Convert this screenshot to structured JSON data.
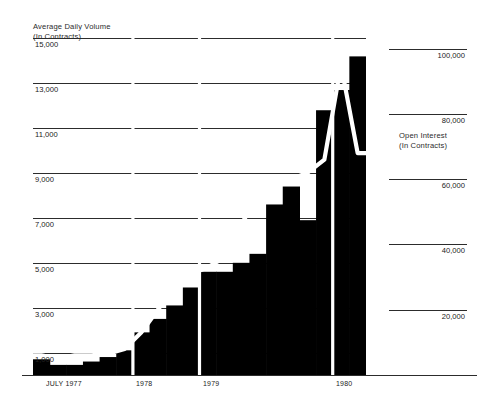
{
  "left_axis": {
    "title_line1": "Average Daily Volume",
    "title_line2": "(In Contracts)",
    "ticks": [
      "15,000",
      "13,000",
      "11,000",
      "9,000",
      "7,000",
      "5,000",
      "3,000",
      "1,000"
    ]
  },
  "right_axis": {
    "title_line1": "Open Interest",
    "title_line2": "(In Contracts)",
    "ticks": [
      "100,000",
      "80,000",
      "60,000",
      "40,000",
      "20,000"
    ]
  },
  "x_axis": {
    "ticks": [
      "JULY 1977",
      "1978",
      "1979",
      "1980"
    ]
  },
  "colors": {
    "bars": "#000000",
    "line": "#ffffff",
    "axis": "#2c2c2c",
    "background": "#ffffff",
    "text": "#222222"
  },
  "chart_data": {
    "type": "bar",
    "title": "Average Daily Volume",
    "subtitle": "(In Contracts)",
    "xlabel": "",
    "ylabel": "Average Daily Volume (In Contracts)",
    "ylim": [
      0,
      16000
    ],
    "y2label": "Open Interest (In Contracts)",
    "y2lim": [
      0,
      110000
    ],
    "grid": true,
    "legend": "none",
    "categories": [
      "1977-Q3",
      "1977-Q4",
      "1978-Q1",
      "1978-Q2",
      "1978-Q3",
      "1978-Q4",
      "1979-Q1",
      "1979-Q2",
      "1979-Q3",
      "1979-Q4",
      "1980-Q1",
      "1980-Q2",
      "1980-Q3",
      "1980-Q4",
      "1981-Q1",
      "1981-Q2",
      "1981-Q3",
      "1981-Q4",
      "1982-Q1",
      "1982-Q2"
    ],
    "series": [
      {
        "name": "Average Daily Volume",
        "type": "bar",
        "axis": "left",
        "values": [
          700,
          450,
          450,
          600,
          800,
          1100,
          1900,
          2500,
          3100,
          3900,
          4600,
          4600,
          5000,
          5400,
          7600,
          8400,
          6900,
          11800,
          12700,
          14200
        ]
      },
      {
        "name": "Open Interest",
        "type": "line",
        "axis": "right",
        "values": [
          6000,
          5000,
          6000,
          6000,
          6500,
          8000,
          13000,
          20000,
          27000,
          31000,
          33000,
          36000,
          46000,
          55000,
          58000,
          60000,
          62000,
          66000,
          95000,
          68000
        ]
      }
    ],
    "annotations": [
      {
        "type": "year-divider",
        "label": "1978"
      },
      {
        "type": "year-divider",
        "label": "1979"
      },
      {
        "type": "year-divider",
        "label": "1980"
      }
    ]
  }
}
